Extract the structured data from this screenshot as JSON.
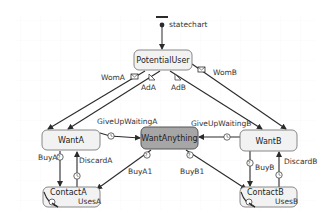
{
  "diagram": {
    "type": "statechart",
    "entry": {
      "label": "statechart"
    },
    "states": [
      {
        "id": "PotentialUser",
        "label": "PotentialUser",
        "fill": "#f2f2f2"
      },
      {
        "id": "WantA",
        "label": "WantA",
        "fill": "#f2f2f2"
      },
      {
        "id": "WantAnything",
        "label": "WantAnything",
        "fill": "#a6a6a6"
      },
      {
        "id": "WantB",
        "label": "WantB",
        "fill": "#f2f2f2"
      },
      {
        "id": "ContactA",
        "label": "ContactA",
        "action": "UsesA",
        "fill": "#f2f2f2"
      },
      {
        "id": "ContactB",
        "label": "ContactB",
        "action": "UsesB",
        "fill": "#f2f2f2"
      }
    ],
    "transitions": [
      {
        "label": "WomA",
        "from": "PotentialUser",
        "to": "WantA",
        "trigger": "message"
      },
      {
        "label": "AdA",
        "from": "PotentialUser",
        "to": "WantA",
        "trigger": "rate"
      },
      {
        "label": "AdB",
        "from": "PotentialUser",
        "to": "WantB",
        "trigger": "rate"
      },
      {
        "label": "WomB",
        "from": "PotentialUser",
        "to": "WantB",
        "trigger": "message"
      },
      {
        "label": "GiveUpWaitingA",
        "from": "WantA",
        "to": "WantAnything",
        "trigger": "timeout"
      },
      {
        "label": "GiveUpWaitingB",
        "from": "WantB",
        "to": "WantAnything",
        "trigger": "timeout"
      },
      {
        "label": "BuyA",
        "from": "WantA",
        "to": "ContactA",
        "trigger": "condition"
      },
      {
        "label": "DiscardA",
        "from": "ContactA",
        "to": "WantA",
        "trigger": "timeout"
      },
      {
        "label": "BuyA1",
        "from": "WantAnything",
        "to": "ContactA",
        "trigger": "condition"
      },
      {
        "label": "BuyB1",
        "from": "WantAnything",
        "to": "ContactB",
        "trigger": "condition"
      },
      {
        "label": "BuyB",
        "from": "WantB",
        "to": "ContactB",
        "trigger": "condition"
      },
      {
        "label": "DiscardB",
        "from": "ContactB",
        "to": "WantB",
        "trigger": "timeout"
      }
    ],
    "colors": {
      "line": "#2b2b2b",
      "state_border": "#7a7a7a",
      "grid": "#f0f0f0"
    }
  }
}
